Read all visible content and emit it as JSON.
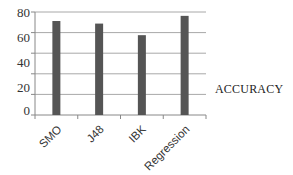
{
  "chart_data": {
    "type": "bar",
    "title": "",
    "xlabel": "",
    "ylabel": "",
    "categories": [
      "SMO",
      "J48",
      "IBK",
      "Regression"
    ],
    "series": [
      {
        "name": "ACCURACY",
        "values": [
          73,
          71,
          62,
          77
        ],
        "color": "#555555"
      }
    ],
    "yticks": [
      "0",
      "20",
      "40",
      "60",
      "80"
    ],
    "ylim": [
      0,
      80
    ],
    "grid": true,
    "legend_position": "right"
  },
  "legend": {
    "label": "ACCURACY"
  }
}
